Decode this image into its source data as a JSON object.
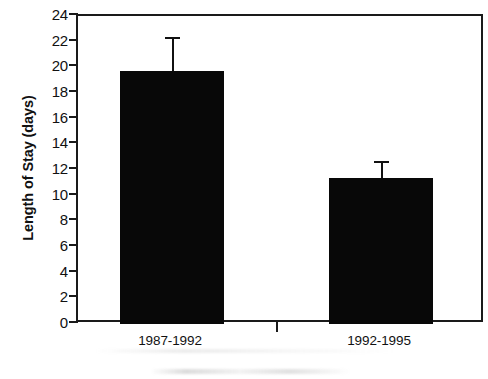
{
  "chart_data": {
    "type": "bar",
    "title": "",
    "xlabel": "",
    "ylabel": "Length of Stay (days)",
    "categories": [
      "1987-1992",
      "1992-1995"
    ],
    "values": [
      19.7,
      11.4
    ],
    "errors_upper": [
      2.7,
      1.3
    ],
    "error_tops": [
      22.4,
      12.7
    ],
    "ylim": [
      0,
      24
    ],
    "ytick_step": 2,
    "yticks": [
      0,
      2,
      4,
      6,
      8,
      10,
      12,
      14,
      16,
      18,
      20,
      22,
      24
    ],
    "ytick_labels": [
      "0",
      "2",
      "4",
      "6",
      "8",
      "10",
      "12",
      "14",
      "16",
      "18",
      "20",
      "22",
      "24"
    ],
    "grid": false,
    "legend": false,
    "legend_position": "none",
    "bar_color": "#080808",
    "axis_color": "#1a1a1a",
    "background_color": "#ffffff",
    "series": [
      {
        "name": "Length of Stay",
        "values": [
          19.7,
          11.4
        ],
        "errors_upper": [
          2.7,
          1.3
        ]
      }
    ]
  }
}
